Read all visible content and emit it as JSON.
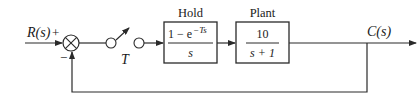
{
  "diagram": {
    "type": "block-diagram",
    "input": {
      "label": "R(s)",
      "sign": "+"
    },
    "summing_junction": {
      "plus_sign": "+",
      "minus_sign": "−"
    },
    "sampler": {
      "label": "T"
    },
    "blocks": [
      {
        "id": "hold",
        "title": "Hold",
        "numerator_prefix": "1 −  e",
        "numerator_exponent": "−Ts",
        "denominator": "s"
      },
      {
        "id": "plant",
        "title": "Plant",
        "numerator": "10",
        "denominator": "s + 1"
      }
    ],
    "output": {
      "label": "C(s)"
    },
    "feedback": {
      "type": "unity",
      "sign": "−"
    },
    "colors": {
      "line": "#2a2a2a",
      "text": "#1a1a1a",
      "background": "#ffffff"
    }
  }
}
